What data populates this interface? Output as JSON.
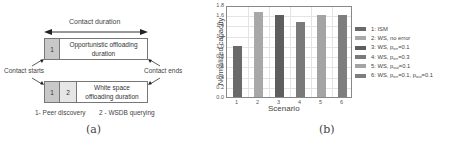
{
  "panel_a": {
    "caption": "(a)",
    "contact_duration_label": "Contact duration",
    "top_box": {
      "cell1": "1",
      "main_line1": "Opportunistic offloading",
      "main_line2": "duration"
    },
    "bottom_box": {
      "cell1": "1",
      "cell2": "2",
      "main_line1": "White space",
      "main_line2": "offloading duration"
    },
    "contact_starts_label": "Contact starts",
    "contact_ends_label": "Contact ends",
    "legend_1": "1- Peer discovery",
    "legend_2": "2 - WSDB querying"
  },
  "panel_b": {
    "caption": "(b)"
  },
  "chart_data": {
    "type": "bar",
    "title": "",
    "xlabel": "Scenario",
    "ylabel": "Normalized capacity",
    "categories": [
      "1",
      "2",
      "3",
      "4",
      "5",
      "6"
    ],
    "values": [
      1.0,
      1.67,
      1.6,
      1.47,
      1.6,
      1.6
    ],
    "colors": [
      "#6a6a6a",
      "#a8a8a8",
      "#5e5e5e",
      "#7a7a7a",
      "#a4a4a4",
      "#7e7e7e"
    ],
    "ylim": [
      0.0,
      1.8
    ],
    "yticks": [
      "0.0",
      "0.2",
      "0.4",
      "0.6",
      "0.8",
      "1.0",
      "1.2",
      "1.4",
      "1.6",
      "1.8"
    ],
    "grid": true,
    "legend_position": "right",
    "legend": [
      {
        "label": "1: ISM",
        "base": "1: ISM",
        "sub": "",
        "rest": ""
      },
      {
        "label": "2: WS, no error",
        "base": "2: WS, no error",
        "sub": "",
        "rest": ""
      },
      {
        "label": "3: WS, p_err=0.1",
        "base": "3: WS, p",
        "sub": "err",
        "rest": "=0.1"
      },
      {
        "label": "4: WS, p_err=0.3",
        "base": "4: WS, p",
        "sub": "err",
        "rest": "=0.3"
      },
      {
        "label": "5: WS, p_out=0.1",
        "base": "5: WS, p",
        "sub": "out",
        "rest": "=0.1"
      },
      {
        "label": "6: WS, p_err=0.1, p_out=0.1",
        "base": "6: WS, p",
        "sub": "err",
        "rest": "=0.1, p",
        "sub2": "out",
        "rest2": "=0.1"
      }
    ]
  }
}
